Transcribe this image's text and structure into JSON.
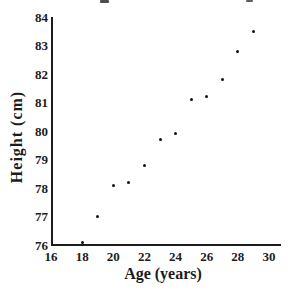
{
  "figure": {
    "background": "#ffffff"
  },
  "chart_data": {
    "type": "scatter",
    "title": "",
    "xlabel": "Age (years)",
    "ylabel": "Height (cm)",
    "x": [
      18,
      19,
      20,
      21,
      22,
      23,
      24,
      25,
      26,
      27,
      28,
      29
    ],
    "y": [
      76.1,
      77.0,
      78.1,
      78.2,
      78.8,
      79.7,
      79.9,
      81.1,
      81.2,
      81.8,
      82.8,
      83.5
    ],
    "xlim": [
      16,
      30
    ],
    "ylim": [
      76,
      84
    ],
    "xticks": [
      16,
      18,
      20,
      22,
      24,
      26,
      28,
      30
    ],
    "yticks": [
      76,
      77,
      78,
      79,
      80,
      81,
      82,
      83,
      84
    ],
    "grid": false,
    "legend": false,
    "marker": "dot",
    "point_color": "#111111",
    "axis_color": "#1c1c1c",
    "text_color": "#1c1c1c"
  }
}
